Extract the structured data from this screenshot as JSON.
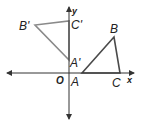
{
  "figure": {
    "axes": {
      "x_label": "x",
      "y_label": "y",
      "origin_label": "O",
      "color": "#333333"
    },
    "triangle_original": {
      "name": "ABC",
      "color": "#4a4a4a",
      "vertices": [
        {
          "label": "A",
          "px": 82,
          "py": 73
        },
        {
          "label": "B",
          "px": 114,
          "py": 37
        },
        {
          "label": "C",
          "px": 120,
          "py": 73
        }
      ]
    },
    "triangle_image": {
      "name": "A'B'C'",
      "color": "#8a8a8a",
      "vertices": [
        {
          "label": "A'",
          "px": 69,
          "py": 60
        },
        {
          "label": "B'",
          "px": 35,
          "py": 25
        },
        {
          "label": "C'",
          "px": 69,
          "py": 21
        }
      ]
    }
  }
}
